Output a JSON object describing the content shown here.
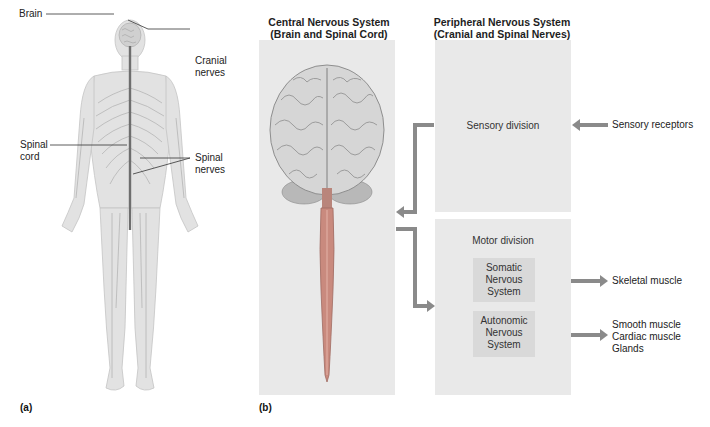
{
  "panel_a": {
    "figure_label": "(a)",
    "labels": {
      "brain": "Brain",
      "cranial_nerves_1": "Cranial",
      "cranial_nerves_2": "nerves",
      "spinal_cord_1": "Spinal",
      "spinal_cord_2": "cord",
      "spinal_nerves_1": "Spinal",
      "spinal_nerves_2": "nerves"
    }
  },
  "panel_b": {
    "figure_label": "(b)",
    "cns": {
      "title_line1": "Central Nervous System",
      "title_line2": "(Brain and Spinal Cord)"
    },
    "pns": {
      "title_line1": "Peripheral Nervous System",
      "title_line2": "(Cranial and Spinal Nerves)",
      "sensory_division": "Sensory division",
      "motor_division": "Motor division",
      "somatic": [
        "Somatic",
        "Nervous",
        "System"
      ],
      "autonomic": [
        "Autonomic",
        "Nervous",
        "System"
      ]
    },
    "targets": {
      "sensory_receptors": "Sensory receptors",
      "skeletal_muscle": "Skeletal muscle",
      "autonomic_targets": [
        "Smooth muscle",
        "Cardiac muscle",
        "Glands"
      ]
    },
    "colors": {
      "arrow": "#8a8a8a",
      "panel_bg": "#e9e9e9",
      "subbox_bg": "#d9d9d9",
      "spinal_cord": "#c98a7e"
    }
  }
}
